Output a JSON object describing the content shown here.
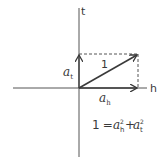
{
  "diagram": {
    "axes": {
      "horizontal_label": "h",
      "vertical_label": "t"
    },
    "vector": {
      "magnitude_label": "1"
    },
    "components": {
      "horizontal": {
        "symbol": "a",
        "subscript": "h"
      },
      "vertical": {
        "symbol": "a",
        "subscript": "t"
      }
    },
    "equation": {
      "lhs": "1",
      "equals": "=",
      "term1": {
        "symbol": "a",
        "subscript": "h",
        "superscript": "2"
      },
      "plus": "+",
      "term2": {
        "symbol": "a",
        "subscript": "t",
        "superscript": "2"
      }
    },
    "colors": {
      "line": "#3a3a3a",
      "background": "#ffffff"
    }
  }
}
